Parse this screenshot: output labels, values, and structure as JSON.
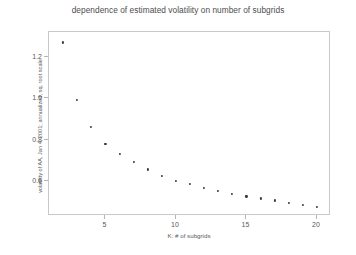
{
  "chart_data": {
    "type": "scatter",
    "title": "dependence of estimated volatility on number of subgrids",
    "xlabel": "K: # of subgrids",
    "ylabel": "volatility of AA, Jan 4, 2001; annualized, sq. root scale",
    "xlim": [
      1,
      21
    ],
    "ylim": [
      0.43,
      1.32
    ],
    "xticks": [
      5,
      10,
      15,
      20
    ],
    "yticks": [
      1.2,
      1.0,
      0.8,
      0.6
    ],
    "xtick_labels": [
      "5",
      "10",
      "15",
      "20"
    ],
    "ytick_labels": [
      "1.2",
      "1.0",
      "0.8",
      "0.6"
    ],
    "grid": false,
    "legend": "none",
    "marker_color": "#3a3a3a",
    "frame_color": "#c9c9c9",
    "x": [
      2,
      3,
      4,
      5,
      6,
      7,
      8,
      9,
      10,
      11,
      12,
      13,
      14,
      15,
      16,
      17,
      18,
      19,
      20
    ],
    "values": [
      1.27,
      0.99,
      0.86,
      0.78,
      0.73,
      0.69,
      0.655,
      0.625,
      0.6,
      0.585,
      0.565,
      0.55,
      0.535,
      0.525,
      0.515,
      0.505,
      0.495,
      0.485,
      0.475
    ],
    "series": [
      {
        "name": "estimated volatility",
        "values": [
          1.27,
          0.99,
          0.86,
          0.78,
          0.73,
          0.69,
          0.655,
          0.625,
          0.6,
          0.585,
          0.565,
          0.55,
          0.535,
          0.525,
          0.515,
          0.505,
          0.495,
          0.485,
          0.475
        ]
      }
    ]
  }
}
